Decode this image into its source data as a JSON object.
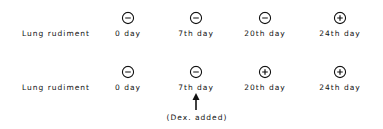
{
  "rows": [
    {
      "label": "Lung rudiment",
      "items": [
        {
          "day": "0 day",
          "result": "negative"
        },
        {
          "day": "7th day",
          "result": "negative"
        },
        {
          "day": "20th day",
          "result": "negative"
        },
        {
          "day": "24th day",
          "result": "positive"
        }
      ]
    },
    {
      "label": "Lung rudiment",
      "items": [
        {
          "day": "0 day",
          "result": "negative"
        },
        {
          "day": "7th day",
          "result": "negative"
        },
        {
          "day": "20th day",
          "result": "positive"
        },
        {
          "day": "24th day",
          "result": "positive"
        }
      ]
    }
  ],
  "annotation": {
    "text": "(Dex. added)",
    "points_to": "7th day"
  }
}
